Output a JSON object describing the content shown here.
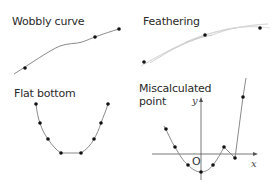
{
  "panels": {
    "wobbly": {
      "title": "Wobbly curve",
      "points": [
        [
          25,
          68
        ],
        [
          95,
          37
        ],
        [
          119,
          29
        ]
      ],
      "curve": "M14,74 C30,64 50,50 60,46 C68,43 76,44 82,42 C88,40 92,38 95,37 C103,34 112,31 119,29"
    },
    "feathering": {
      "title": "Feathering",
      "points": [
        [
          144,
          62
        ],
        [
          205,
          35
        ],
        [
          260,
          28
        ]
      ]
    },
    "flat_bottom": {
      "title": "Flat bottom",
      "points": [
        [
          36,
          104
        ],
        [
          40,
          123
        ],
        [
          48,
          139
        ],
        [
          61,
          153
        ],
        [
          81,
          153
        ],
        [
          94,
          139
        ],
        [
          101,
          123
        ],
        [
          108,
          104
        ]
      ]
    },
    "miscalculated": {
      "title_line1": "Miscalculated",
      "title_line2": "point",
      "axis_x_label": "x",
      "axis_y_label": "y",
      "origin_label": "O",
      "points": [
        [
          166,
          129
        ],
        [
          175,
          147
        ],
        [
          188,
          165
        ],
        [
          201,
          172
        ],
        [
          213,
          165
        ],
        [
          224,
          147
        ],
        [
          235,
          158
        ],
        [
          243,
          97
        ]
      ]
    }
  },
  "colors": {
    "curve": "#8a8a8a",
    "point": "#111111",
    "axis": "#555555",
    "feather": "#c8c8c8"
  }
}
